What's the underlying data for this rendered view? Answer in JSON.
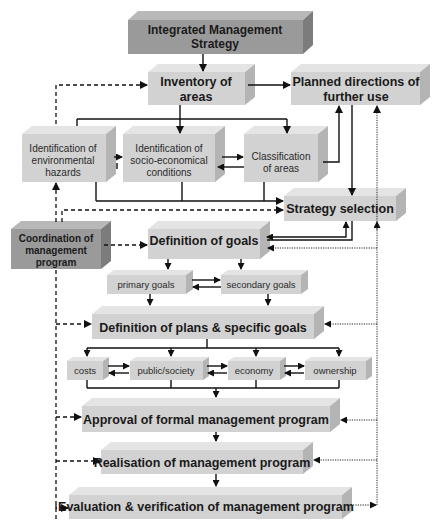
{
  "colors": {
    "box_light_face": "#d2d2d2",
    "box_light_top": "#e4e4e4",
    "box_light_side": "#b4b4b4",
    "box_dark_face": "#9a9a9a",
    "box_dark_top": "#b8b8b8",
    "box_dark_side": "#7c7c7c",
    "line": "#111111"
  },
  "nodes": {
    "ims": {
      "line1": "Integrated Management",
      "line2": "Strategy"
    },
    "inventory": {
      "line1": "Inventory of",
      "line2": "areas"
    },
    "planned": {
      "line1": "Planned directions of",
      "line2": "further use"
    },
    "envhaz": {
      "line1": "Identification of",
      "line2": "environmental",
      "line3": "hazards"
    },
    "socio": {
      "line1": "Identification of",
      "line2": "socio-economical",
      "line3": "conditions"
    },
    "classif": {
      "line1": "Classification",
      "line2": "of areas"
    },
    "strategy": {
      "label": "Strategy selection"
    },
    "coord": {
      "line1": "Coordination of",
      "line2": "management",
      "line3": "program"
    },
    "goals": {
      "label": "Definition of goals"
    },
    "primary": {
      "label": "primary goals"
    },
    "secondary": {
      "label": "secondary goals"
    },
    "plans": {
      "label": "Definition of plans & specific goals"
    },
    "costs": {
      "label": "costs"
    },
    "public": {
      "label": "public/society"
    },
    "economy": {
      "label": "economy"
    },
    "ownership": {
      "label": "ownership"
    },
    "approval": {
      "label": "Approval of formal management program"
    },
    "realisation": {
      "label": "Realisation of management program"
    },
    "evaluation": {
      "label": "Evaluation & verification of management program"
    }
  }
}
